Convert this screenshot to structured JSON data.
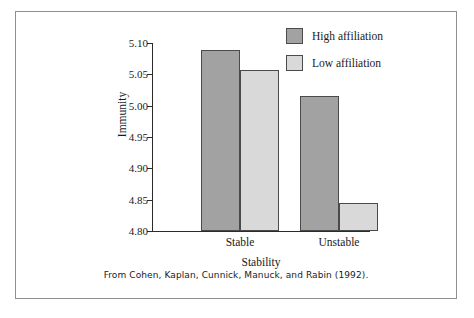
{
  "figure": {
    "source_caption": "From Cohen, Kaplan, Cunnick, Manuck, and Rabin (1992)."
  },
  "legend": {
    "position": "top-right",
    "entries": [
      {
        "label": "High affiliation",
        "color": "#a2a2a2"
      },
      {
        "label": "Low affiliation",
        "color": "#d9d9d9"
      }
    ]
  },
  "axes": {
    "y_title": "Immunity",
    "x_title": "Stability",
    "y_ticks": [
      "4.80",
      "4.85",
      "4.90",
      "4.95",
      "5.00",
      "5.05",
      "5.10"
    ],
    "x_ticks": [
      "Stable",
      "Unstable"
    ]
  },
  "chart_data": {
    "type": "bar",
    "title": "",
    "subtitle": "",
    "xlabel": "Stability",
    "ylabel": "Immunity",
    "categories": [
      "Stable",
      "Unstable"
    ],
    "series": [
      {
        "name": "High affiliation",
        "values": [
          5.089,
          5.015
        ],
        "color": "#a2a2a2"
      },
      {
        "name": "Low affiliation",
        "values": [
          5.057,
          4.844
        ],
        "color": "#d9d9d9"
      }
    ],
    "ylim": [
      4.8,
      5.1
    ],
    "ytick_values": [
      4.8,
      4.85,
      4.9,
      4.95,
      5.0,
      5.05,
      5.1
    ],
    "ytick_labels": [
      "4.80",
      "4.85",
      "4.90",
      "4.95",
      "5.00",
      "5.05",
      "5.10"
    ],
    "grid": false,
    "legend_position": "top-right",
    "annotations": [
      "From Cohen, Kaplan, Cunnick, Manuck, and Rabin (1992)."
    ]
  }
}
